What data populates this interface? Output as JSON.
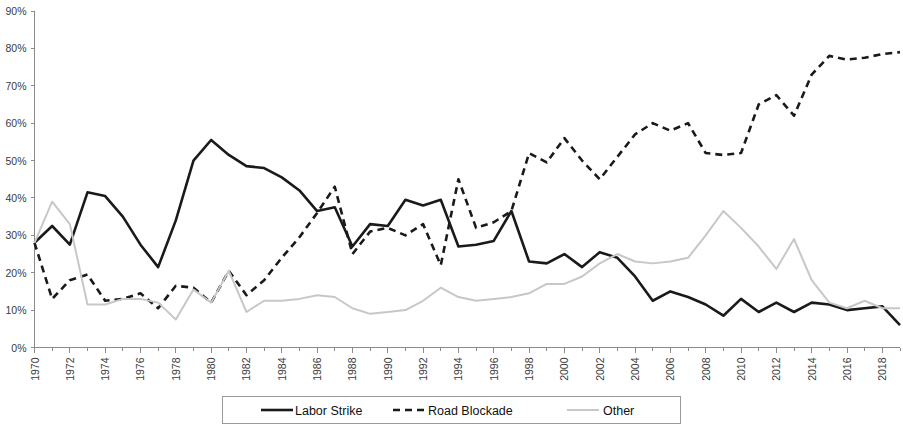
{
  "chart_data": {
    "type": "line",
    "title": "",
    "subtitle": "",
    "xlabel": "",
    "ylabel": "",
    "xlim": [
      1970,
      2019
    ],
    "ylim": [
      0,
      90
    ],
    "ytick_labels": [
      "0%",
      "10%",
      "20%",
      "30%",
      "40%",
      "50%",
      "60%",
      "70%",
      "80%",
      "90%"
    ],
    "ytick_values": [
      0,
      10,
      20,
      30,
      40,
      50,
      60,
      70,
      80,
      90
    ],
    "xtick_labels": [
      "1970",
      "1972",
      "1974",
      "1976",
      "1978",
      "1980",
      "1982",
      "1984",
      "1986",
      "1988",
      "1990",
      "1992",
      "1994",
      "1996",
      "1998",
      "2000",
      "2002",
      "2004",
      "2006",
      "2008",
      "2010",
      "2012",
      "2014",
      "2016",
      "2018"
    ],
    "xtick_values": [
      1970,
      1972,
      1974,
      1976,
      1978,
      1980,
      1982,
      1984,
      1986,
      1988,
      1990,
      1992,
      1994,
      1996,
      1998,
      2000,
      2002,
      2004,
      2006,
      2008,
      2010,
      2012,
      2014,
      2016,
      2018
    ],
    "grid": false,
    "legend_position": "bottom",
    "x": [
      1970,
      1971,
      1972,
      1973,
      1974,
      1975,
      1976,
      1977,
      1978,
      1979,
      1980,
      1981,
      1982,
      1983,
      1984,
      1985,
      1986,
      1987,
      1988,
      1989,
      1990,
      1991,
      1992,
      1993,
      1994,
      1995,
      1996,
      1997,
      1998,
      1999,
      2000,
      2001,
      2002,
      2003,
      2004,
      2005,
      2006,
      2007,
      2008,
      2009,
      2010,
      2011,
      2012,
      2013,
      2014,
      2015,
      2016,
      2017,
      2018,
      2019
    ],
    "series": [
      {
        "name": "Labor Strike",
        "style": "solid",
        "color": "#1a1a1a",
        "width": 2.6,
        "values": [
          28,
          32.5,
          27.5,
          41.5,
          40.5,
          35,
          27.5,
          21.5,
          34,
          50,
          55.5,
          51.5,
          48.5,
          48,
          45.5,
          42,
          36.5,
          37.5,
          27,
          33,
          32.5,
          39.5,
          38,
          39.5,
          27,
          27.5,
          28.5,
          36.5,
          23,
          22.5,
          25,
          21.5,
          25.5,
          24,
          19,
          12.5,
          15,
          13.5,
          11.5,
          8.5,
          13,
          9.5,
          12,
          9.5,
          12,
          11.5,
          10,
          10.5,
          11,
          6
        ]
      },
      {
        "name": "Road Blockade",
        "style": "dashed",
        "color": "#1a1a1a",
        "width": 2.6,
        "values": [
          28,
          13,
          18,
          19.5,
          12.5,
          13,
          14.5,
          10.5,
          16.5,
          16,
          12,
          20.5,
          14,
          18,
          24,
          29.5,
          36,
          43,
          25,
          31,
          32,
          30,
          33,
          22,
          45,
          32,
          33.5,
          36.5,
          52,
          49.5,
          56,
          50,
          45,
          51,
          57,
          60,
          58,
          60,
          52,
          51.5,
          52,
          65,
          67.5,
          62,
          73,
          78,
          77,
          77.5,
          78.5,
          79
        ]
      },
      {
        "name": "Other",
        "style": "solid",
        "color": "#c7c7c7",
        "width": 2.0,
        "values": [
          28,
          39,
          33,
          11.5,
          11.5,
          13,
          13,
          12,
          7.5,
          15.5,
          12,
          20.5,
          9.5,
          12.5,
          12.5,
          13,
          14,
          13.5,
          10.5,
          9,
          9.5,
          10,
          12.5,
          16,
          13.5,
          12.5,
          13,
          13.5,
          14.5,
          17,
          17,
          19,
          22.5,
          25,
          23,
          22.5,
          23,
          24,
          30,
          36.5,
          32,
          27,
          21,
          29,
          18,
          12,
          10.5,
          12.5,
          10.5,
          10.5
        ]
      }
    ]
  },
  "legend": {
    "items": [
      {
        "label": "Labor Strike",
        "style": "solid",
        "color": "#1a1a1a"
      },
      {
        "label": "Road Blockade",
        "style": "dashed",
        "color": "#1a1a1a"
      },
      {
        "label": "Other",
        "style": "solid",
        "color": "#c7c7c7"
      }
    ]
  }
}
